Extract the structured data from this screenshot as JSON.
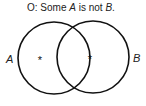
{
  "title": {
    "prefix": "O:  Some ",
    "subject": "A",
    "middle": " is not ",
    "predicate": "B",
    "suffix": "."
  },
  "circles": [
    {
      "label": "A",
      "cx": 54,
      "cy": 58,
      "r": 36
    },
    {
      "label": "B",
      "cx": 93,
      "cy": 57,
      "r": 36
    }
  ],
  "marks": [
    {
      "symbol": "*",
      "x": 40,
      "y": 60,
      "region": "A only"
    },
    {
      "symbol": "*",
      "x": 89,
      "y": 59,
      "region": "on border of A within B"
    }
  ],
  "colors": {
    "stroke": "#111111",
    "text": "#222222"
  }
}
